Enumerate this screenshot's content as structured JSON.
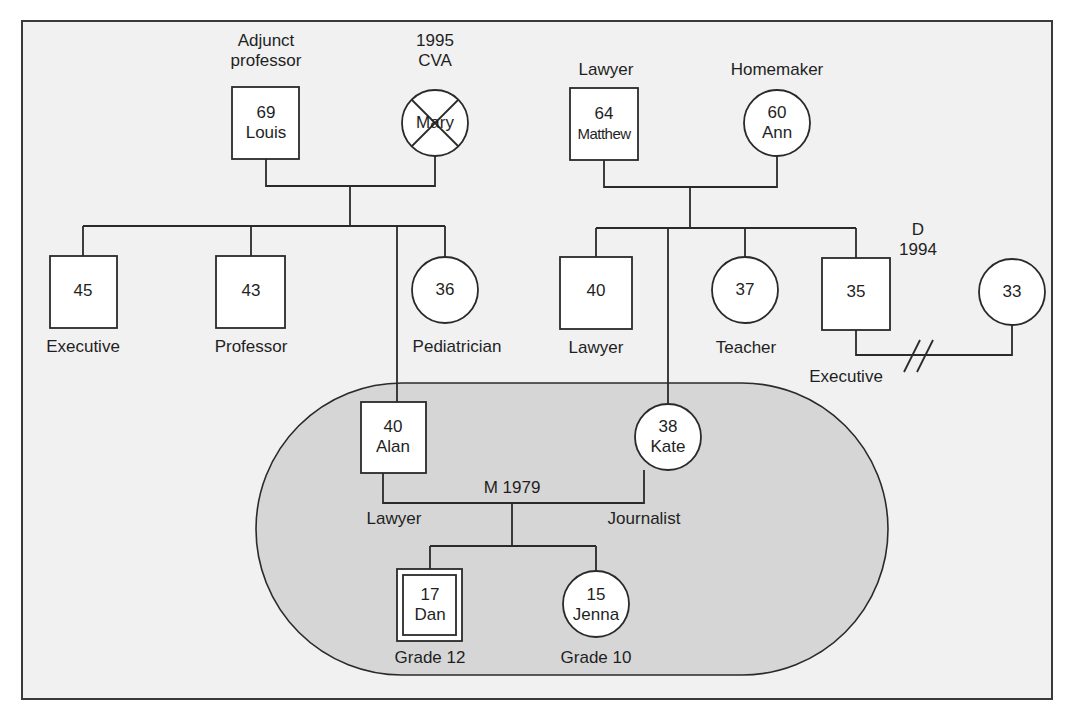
{
  "diagram": {
    "type": "genogram",
    "household_fill": "#d6d6d6",
    "node_fill": "#ffffff",
    "line_color": "#2a2a2a"
  },
  "people": {
    "louis": {
      "age": "69",
      "name": "Louis",
      "sex": "male",
      "label": "Adjunct professor",
      "label_line1": "Adjunct",
      "label_line2": "professor"
    },
    "mary": {
      "age": "",
      "name": "Mary",
      "sex": "female",
      "deceased": true,
      "label_line1": "1995",
      "label_line2": "CVA"
    },
    "matthew": {
      "age": "64",
      "name": "Matthew",
      "sex": "male",
      "label": "Lawyer"
    },
    "ann": {
      "age": "60",
      "name": "Ann",
      "sex": "female",
      "label": "Homemaker"
    },
    "louis_son_45": {
      "age": "45",
      "sex": "male",
      "label": "Executive"
    },
    "louis_son_43": {
      "age": "43",
      "sex": "male",
      "label": "Professor"
    },
    "louis_dau_36": {
      "age": "36",
      "sex": "female",
      "label": "Pediatrician"
    },
    "matthew_son_40": {
      "age": "40",
      "sex": "male",
      "label": "Lawyer"
    },
    "matthew_dau_37": {
      "age": "37",
      "sex": "female",
      "label": "Teacher"
    },
    "matthew_son_35": {
      "age": "35",
      "sex": "male",
      "label": "Executive"
    },
    "ex_wife_33": {
      "age": "33",
      "sex": "female",
      "label": ""
    },
    "alan": {
      "age": "40",
      "name": "Alan",
      "sex": "male",
      "label": "Lawyer"
    },
    "kate": {
      "age": "38",
      "name": "Kate",
      "sex": "female",
      "label": "Journalist"
    },
    "dan": {
      "age": "17",
      "name": "Dan",
      "sex": "male",
      "identified_patient": true,
      "label": "Grade 12"
    },
    "jenna": {
      "age": "15",
      "name": "Jenna",
      "sex": "female",
      "label": "Grade 10"
    }
  },
  "relationships": {
    "alan_kate": {
      "type": "marriage",
      "label": "M 1979"
    },
    "son35_wife33": {
      "type": "divorce",
      "label_line1": "D",
      "label_line2": "1994",
      "symbol": "//"
    }
  }
}
